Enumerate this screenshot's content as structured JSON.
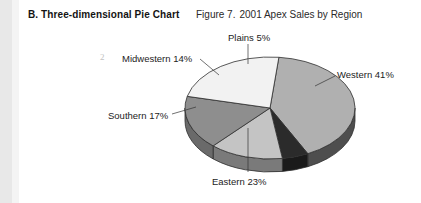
{
  "document": {
    "section_letter": "B.",
    "section_title": "Three-dimensional Pie Chart",
    "figure_number": "Figure 7.",
    "figure_title": "2001 Apex Sales by Region",
    "page_artifact": "2"
  },
  "labels": {
    "plains": "Plains 5%",
    "midwestern": "Midwestern 14%",
    "western": "Western 41%",
    "southern": "Southern 17%",
    "eastern": "Eastern 23%"
  },
  "chart_data": {
    "type": "pie",
    "title": "2001 Apex Sales by Region",
    "subtitle": "Figure 7.",
    "three_dimensional": true,
    "legend": "none",
    "labels_position": "outside-with-leader-lines",
    "units": "percent",
    "total": 100,
    "categories": [
      "Western",
      "Plains",
      "Midwestern",
      "Southern",
      "Eastern"
    ],
    "values": [
      41,
      5,
      14,
      17,
      23
    ],
    "slices": [
      {
        "name": "Western",
        "value": 41,
        "label": "Western 41%",
        "color": "#b0b0b0",
        "side_color": "#4e4e4e"
      },
      {
        "name": "Plains",
        "value": 5,
        "label": "Plains 5%",
        "color": "#2b2b2b",
        "side_color": "#1a1a1a"
      },
      {
        "name": "Midwestern",
        "value": 14,
        "label": "Midwestern 14%",
        "color": "#c4c4c4",
        "side_color": "#7a7a7a"
      },
      {
        "name": "Southern",
        "value": 17,
        "label": "Southern 17%",
        "color": "#8e8e8e",
        "side_color": "#6a6a6a"
      },
      {
        "name": "Eastern",
        "value": 23,
        "label": "Eastern 23%",
        "color": "#f2f2f2",
        "side_color": "#9a9a9a"
      }
    ]
  }
}
